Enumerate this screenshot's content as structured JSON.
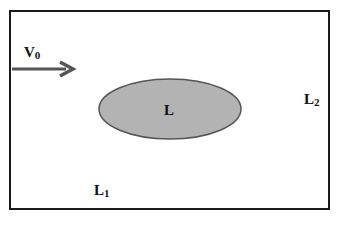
{
  "diagram": {
    "frame": {
      "stroke": "#1a1a1a"
    },
    "velocity": {
      "symbol": "V",
      "subscript": "0",
      "arrow_color": "#555555"
    },
    "ellipse": {
      "label": "L",
      "fill": "#b3b3b3",
      "stroke": "#555555"
    },
    "region_left": {
      "symbol": "L",
      "subscript": "1"
    },
    "region_right": {
      "symbol": "L",
      "subscript": "2"
    }
  }
}
